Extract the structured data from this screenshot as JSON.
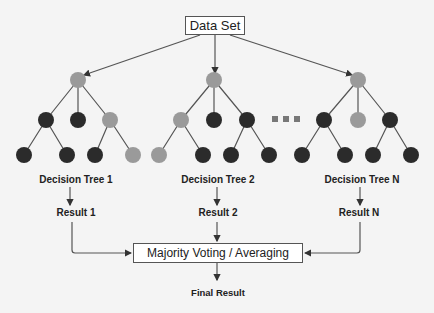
{
  "diagram": {
    "source_node": "Data Set",
    "trees": [
      {
        "label": "Decision Tree 1",
        "result": "Result 1"
      },
      {
        "label": "Decision Tree 2",
        "result": "Result 2"
      },
      {
        "label": "Decision Tree N",
        "result": "Result N"
      }
    ],
    "ellipsis": "...",
    "aggregator": "Majority Voting / Averaging",
    "final": "Final Result",
    "colors": {
      "dark_node": "#2b2b2b",
      "light_node": "#9a9a9a",
      "edge": "#555555",
      "background": "#f4f4f4"
    }
  }
}
